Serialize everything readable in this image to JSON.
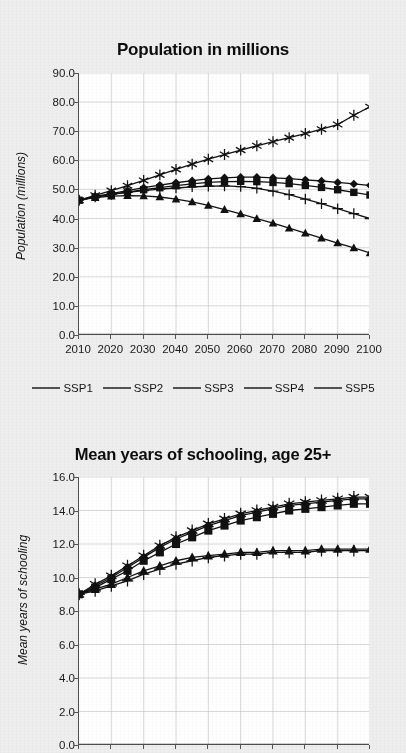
{
  "figure": {
    "background_color": "#eeeeee",
    "plot_background_color": "#ffffff",
    "line_color": "#111111",
    "grid_color": "#c9c9c9"
  },
  "legend": {
    "position": "between-charts",
    "items": [
      {
        "label": "SSP1",
        "marker": "diamond-marker-icon"
      },
      {
        "label": "SSP2",
        "marker": "square-marker-icon"
      },
      {
        "label": "SSP3",
        "marker": "triangle-marker-icon"
      },
      {
        "label": "SSP4",
        "marker": "plus-marker-icon"
      },
      {
        "label": "SSP5",
        "marker": "asterisk-marker-icon"
      }
    ]
  },
  "chart_data": [
    {
      "type": "line",
      "title": "Population in millions",
      "xlabel": "",
      "ylabel": "Population (millions)",
      "xlim": [
        2010,
        2100
      ],
      "ylim": [
        0.0,
        90.0
      ],
      "yticks": [
        "0.0",
        "10.0",
        "20.0",
        "30.0",
        "40.0",
        "50.0",
        "60.0",
        "70.0",
        "80.0",
        "90.0"
      ],
      "xticks": [
        "2010",
        "2020",
        "2030",
        "2040",
        "2050",
        "2060",
        "2070",
        "2080",
        "2090",
        "2100"
      ],
      "grid": true,
      "legend_position": "below",
      "x": [
        2010,
        2015,
        2020,
        2025,
        2030,
        2035,
        2040,
        2045,
        2050,
        2055,
        2060,
        2065,
        2070,
        2075,
        2080,
        2085,
        2090,
        2095,
        2100
      ],
      "series": [
        {
          "name": "SSP1",
          "marker": "diamond",
          "values": [
            46.3,
            47.6,
            48.6,
            49.6,
            50.6,
            51.5,
            52.3,
            53.0,
            53.6,
            54.0,
            54.2,
            54.2,
            54.0,
            53.7,
            53.3,
            52.9,
            52.4,
            51.9,
            51.4
          ]
        },
        {
          "name": "SSP2",
          "marker": "square",
          "values": [
            46.3,
            47.4,
            48.3,
            49.1,
            49.9,
            50.6,
            51.3,
            51.9,
            52.4,
            52.7,
            52.8,
            52.7,
            52.4,
            52.0,
            51.4,
            50.7,
            49.9,
            49.0,
            48.1
          ]
        },
        {
          "name": "SSP3",
          "marker": "triangle",
          "values": [
            46.3,
            47.2,
            47.7,
            47.9,
            47.8,
            47.4,
            46.7,
            45.7,
            44.5,
            43.1,
            41.6,
            40.0,
            38.4,
            36.7,
            35.0,
            33.3,
            31.6,
            29.9,
            28.2
          ]
        },
        {
          "name": "SSP4",
          "marker": "plus",
          "values": [
            46.3,
            47.4,
            48.3,
            49.0,
            49.6,
            50.1,
            50.5,
            50.9,
            51.1,
            51.2,
            51.0,
            50.4,
            49.4,
            48.2,
            46.7,
            45.1,
            43.4,
            41.7,
            40.0
          ]
        },
        {
          "name": "SSP5",
          "marker": "asterisk",
          "values": [
            46.3,
            48.0,
            49.6,
            51.3,
            53.1,
            55.0,
            56.9,
            58.7,
            60.4,
            62.0,
            63.5,
            65.0,
            66.4,
            67.8,
            69.2,
            70.7,
            72.3,
            75.5,
            78.4
          ]
        }
      ]
    },
    {
      "type": "line",
      "title": "Mean years of schooling, age 25+",
      "xlabel": "",
      "ylabel": "Mean years of schooling",
      "xlim": [
        2010,
        2100
      ],
      "ylim": [
        0.0,
        16.0
      ],
      "yticks": [
        "0.0",
        "2.0",
        "4.0",
        "6.0",
        "8.0",
        "10.0",
        "12.0",
        "14.0",
        "16.0"
      ],
      "xticks": [],
      "grid": true,
      "legend_position": "above",
      "x": [
        2010,
        2015,
        2020,
        2025,
        2030,
        2035,
        2040,
        2045,
        2050,
        2055,
        2060,
        2065,
        2070,
        2075,
        2080,
        2085,
        2090,
        2095,
        2100
      ],
      "series": [
        {
          "name": "SSP1",
          "marker": "diamond",
          "values": [
            9.0,
            9.5,
            10.0,
            10.6,
            11.2,
            11.8,
            12.3,
            12.7,
            13.1,
            13.4,
            13.7,
            13.9,
            14.1,
            14.3,
            14.4,
            14.5,
            14.6,
            14.7,
            14.7
          ]
        },
        {
          "name": "SSP2",
          "marker": "square",
          "values": [
            9.0,
            9.4,
            9.9,
            10.4,
            11.0,
            11.5,
            12.0,
            12.4,
            12.8,
            13.1,
            13.4,
            13.6,
            13.8,
            14.0,
            14.1,
            14.2,
            14.3,
            14.4,
            14.4
          ]
        },
        {
          "name": "SSP3",
          "marker": "triangle",
          "values": [
            9.0,
            9.3,
            9.6,
            10.0,
            10.4,
            10.7,
            11.0,
            11.2,
            11.3,
            11.4,
            11.5,
            11.5,
            11.6,
            11.6,
            11.6,
            11.7,
            11.7,
            11.7,
            11.7
          ]
        },
        {
          "name": "SSP4",
          "marker": "plus",
          "values": [
            9.0,
            9.2,
            9.5,
            9.8,
            10.2,
            10.5,
            10.8,
            11.0,
            11.2,
            11.3,
            11.4,
            11.4,
            11.5,
            11.5,
            11.5,
            11.6,
            11.6,
            11.6,
            11.6
          ]
        },
        {
          "name": "SSP5",
          "marker": "asterisk",
          "values": [
            9.0,
            9.6,
            10.1,
            10.7,
            11.3,
            11.9,
            12.4,
            12.8,
            13.2,
            13.5,
            13.8,
            14.0,
            14.2,
            14.4,
            14.5,
            14.6,
            14.7,
            14.8,
            14.8
          ]
        }
      ]
    }
  ]
}
